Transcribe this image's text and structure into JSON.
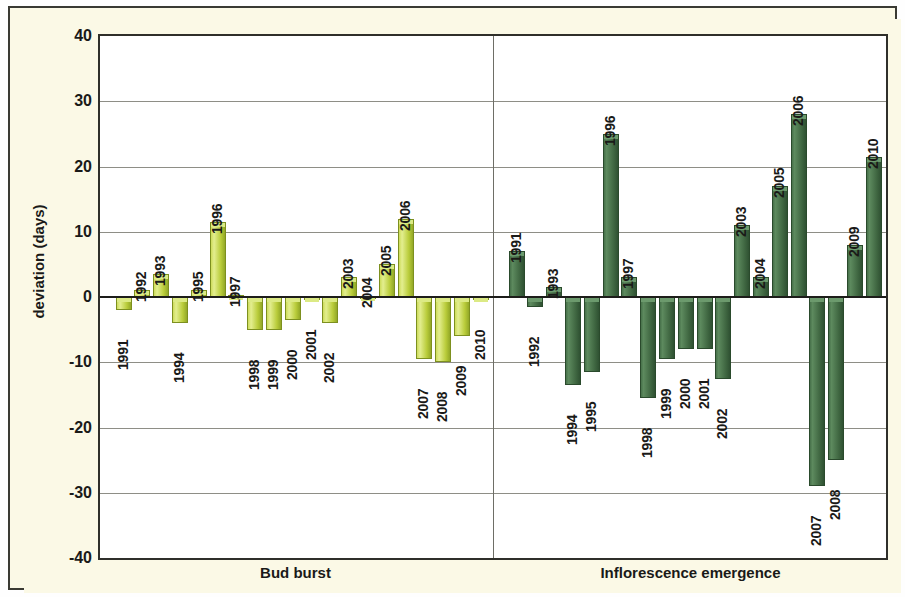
{
  "figure": {
    "y_axis_title": "deviation (days)",
    "panel_captions": [
      "Bud burst",
      "Inflorescence emergence"
    ],
    "background_color": "#fbf9e6",
    "plot_background_color": "#ffffff",
    "border_color": "#2f2f2a",
    "series_colors": {
      "bud_burst": "#c3d43f",
      "inflorescence_emergence": "#3e6540"
    }
  },
  "chart_data": {
    "type": "bar",
    "title": "",
    "subtitle": "",
    "xlabel": "",
    "ylabel": "deviation (days)",
    "ylim": [
      -40,
      40
    ],
    "ytick_labels": [
      "40",
      "30",
      "20",
      "10",
      "0",
      "-10",
      "-20",
      "-30",
      "-40"
    ],
    "yticks": [
      40,
      30,
      20,
      10,
      0,
      -10,
      -20,
      -30,
      -40
    ],
    "grid": true,
    "legend": "none",
    "panels": [
      {
        "name": "Bud burst",
        "color": "#c3d43f",
        "categories": [
          "1991",
          "1992",
          "1993",
          "1994",
          "1995",
          "1996",
          "1997",
          "1998",
          "1999",
          "2000",
          "2001",
          "2002",
          "2003",
          "2004",
          "2005",
          "2006",
          "2007",
          "2008",
          "2009",
          "2010"
        ],
        "values": [
          -2.0,
          1.0,
          3.5,
          -4.0,
          1.0,
          11.5,
          0.3,
          -5.0,
          -5.0,
          -3.5,
          -0.5,
          -4.0,
          3.0,
          0.2,
          5.0,
          12.0,
          -9.5,
          -10.0,
          -6.0,
          -0.5
        ]
      },
      {
        "name": "Inflorescence emergence",
        "color": "#3e6540",
        "categories": [
          "1991",
          "1992",
          "1993",
          "1994",
          "1995",
          "1996",
          "1997",
          "1998",
          "1999",
          "2000",
          "2001",
          "2002",
          "2003",
          "2004",
          "2005",
          "2006",
          "2007",
          "2008",
          "2009",
          "2010"
        ],
        "values": [
          7.0,
          -1.5,
          1.5,
          -13.5,
          -11.5,
          25.0,
          3.0,
          -15.5,
          -9.5,
          -8.0,
          -8.0,
          -12.5,
          11.0,
          3.0,
          17.0,
          28.0,
          -29.0,
          -25.0,
          8.0,
          21.5
        ]
      }
    ]
  }
}
